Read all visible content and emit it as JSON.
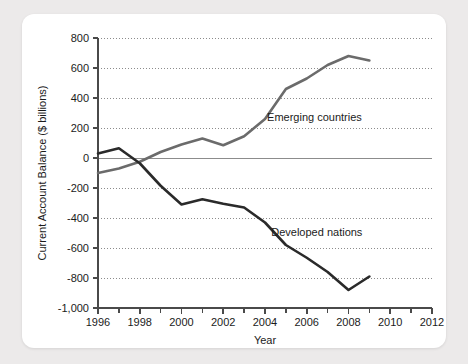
{
  "chart_data": {
    "type": "line",
    "title": "",
    "xlabel": "Year",
    "ylabel": "Current Account Balance ($ billions)",
    "xlim": [
      1996,
      2012
    ],
    "ylim": [
      -1000,
      800
    ],
    "ytick_labels": [
      "800",
      "600",
      "400",
      "200",
      "0",
      "-200",
      "-400",
      "-600",
      "-800",
      "-1,000"
    ],
    "ytick_values": [
      800,
      600,
      400,
      200,
      0,
      -200,
      -400,
      -600,
      -800,
      -1000
    ],
    "xtick_labels": [
      "1996",
      "1998",
      "2000",
      "2002",
      "2004",
      "2006",
      "2008",
      "2010",
      "2012"
    ],
    "xtick_values": [
      1996,
      1998,
      2000,
      2002,
      2004,
      2006,
      2008,
      2010,
      2012
    ],
    "xtick_minor_values": [
      1997,
      1999,
      2001,
      2003,
      2005,
      2007,
      2009,
      2011
    ],
    "grid": "horizontal-dotted",
    "zero_line": true,
    "legend": "inline-annotations",
    "x": [
      1996,
      1997,
      1998,
      1999,
      2000,
      2001,
      2002,
      2003,
      2004,
      2005,
      2006,
      2007,
      2008,
      2009
    ],
    "series": [
      {
        "name": "Emerging countries",
        "color": "#6b6b6b",
        "label_x": 2004.1,
        "label_y": 250,
        "values": [
          -100,
          -70,
          -25,
          40,
          90,
          130,
          85,
          145,
          260,
          460,
          530,
          620,
          680,
          650
        ]
      },
      {
        "name": "Developed nations",
        "color": "#2a2a2a",
        "label_x": 2004.3,
        "label_y": -520,
        "values": [
          30,
          65,
          -35,
          -185,
          -310,
          -275,
          -305,
          -330,
          -430,
          -580,
          -665,
          -760,
          -880,
          -790
        ]
      }
    ]
  },
  "colors": {
    "page_background": "#eceaea",
    "card_background": "#ffffff",
    "axis": "#4a4a4a",
    "grid": "#8c8c8c",
    "zero_line": "#8c8c8c",
    "emerging_series": "#6b6b6b",
    "developed_series": "#2a2a2a",
    "text": "#1b1b1b"
  },
  "axes": {
    "y_title": "Current Account Balance ($ billions)",
    "x_title": "Year"
  }
}
